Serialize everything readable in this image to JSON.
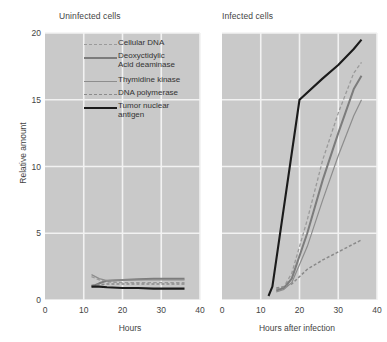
{
  "figure": {
    "yaxis": {
      "label": "Relative amount",
      "ticks": [
        "0",
        "5",
        "10",
        "15",
        "20"
      ],
      "min": 0,
      "max": 20
    },
    "panels": [
      {
        "title": "Uninfected cells",
        "xlabel": "Hours",
        "xticks": [
          "0",
          "10",
          "20",
          "30",
          "40"
        ]
      },
      {
        "title": "Infected cells",
        "xlabel": "Hours after infection",
        "xticks": [
          "0",
          "10",
          "20",
          "30",
          "40"
        ]
      }
    ],
    "legend": [
      {
        "label": "Cellular DNA",
        "style": "dashed-light",
        "color": "#9a9a9a"
      },
      {
        "label": "Deoxyctidylic\nAcid deaminase",
        "line1": "Deoxyctidylic",
        "line2": "Acid deaminase",
        "style": "solid-thick",
        "color": "#7c7c7c"
      },
      {
        "label": "Thymidine kinase",
        "style": "solid-thin",
        "color": "#8d8d8d"
      },
      {
        "label": "DNA polymerase",
        "style": "dashed-dark",
        "color": "#8a8a8a"
      },
      {
        "label": "Tumor nuclear\nantigen",
        "line1": "Tumor nuclear",
        "line2": "antigen",
        "style": "solid-black",
        "color": "#1b1b1b"
      }
    ],
    "colors": {
      "panel_background": "#c9c9c9",
      "gridline": "#f2f2f2",
      "text": "#444444"
    }
  },
  "chart_data": {
    "type": "line",
    "ylabel": "Relative amount",
    "ylim": [
      0,
      20
    ],
    "yticks": [
      0,
      5,
      10,
      15,
      20
    ],
    "grid": true,
    "legend_position": "inside-left-panel-top",
    "panels": [
      {
        "title": "Uninfected cells",
        "xlabel": "Hours",
        "xlim": [
          0,
          40
        ],
        "xticks": [
          0,
          10,
          20,
          30,
          40
        ],
        "series": [
          {
            "name": "Cellular DNA",
            "style": "dashed-light",
            "color": "#9a9a9a",
            "x": [
              12,
              14,
              16,
              20,
              24,
              28,
              32,
              36
            ],
            "y": [
              1.75,
              1.5,
              1.35,
              1.3,
              1.3,
              1.3,
              1.3,
              1.3
            ]
          },
          {
            "name": "Deoxyctidylic Acid deaminase",
            "style": "solid-thick",
            "color": "#7c7c7c",
            "x": [
              12,
              14,
              16,
              20,
              24,
              28,
              32,
              36
            ],
            "y": [
              1.0,
              1.25,
              1.45,
              1.5,
              1.55,
              1.6,
              1.6,
              1.6
            ]
          },
          {
            "name": "Thymidine kinase",
            "style": "solid-thin",
            "color": "#8d8d8d",
            "x": [
              12,
              14,
              16,
              20,
              24,
              28,
              32,
              36
            ],
            "y": [
              1.9,
              1.6,
              1.45,
              1.5,
              1.5,
              1.5,
              1.5,
              1.5
            ]
          },
          {
            "name": "DNA polymerase",
            "style": "dashed-dark",
            "color": "#8a8a8a",
            "x": [
              12,
              14,
              16,
              20,
              24,
              28,
              32,
              36
            ],
            "y": [
              1.1,
              1.15,
              1.2,
              1.2,
              1.2,
              1.2,
              1.2,
              1.2
            ]
          },
          {
            "name": "Tumor nuclear antigen",
            "style": "solid-black",
            "color": "#1b1b1b",
            "x": [
              12,
              14,
              16,
              20,
              24,
              28,
              32,
              36
            ],
            "y": [
              1.0,
              1.0,
              0.95,
              0.9,
              0.9,
              0.85,
              0.85,
              0.85
            ]
          }
        ]
      },
      {
        "title": "Infected cells",
        "xlabel": "Hours after infection",
        "xlim": [
          0,
          40
        ],
        "xticks": [
          0,
          10,
          20,
          30,
          40
        ],
        "series": [
          {
            "name": "Cellular DNA",
            "style": "dashed-light",
            "color": "#9a9a9a",
            "x": [
              14,
              16,
              18,
              22,
              26,
              30,
              34,
              36
            ],
            "y": [
              0.8,
              1.0,
              2.0,
              6.0,
              10.5,
              14.0,
              17.0,
              17.8
            ]
          },
          {
            "name": "Deoxyctidylic Acid deaminase",
            "style": "solid-thick",
            "color": "#7c7c7c",
            "x": [
              14,
              16,
              18,
              22,
              26,
              30,
              34,
              36
            ],
            "y": [
              0.7,
              0.9,
              1.6,
              5.0,
              9.0,
              12.5,
              15.8,
              16.8
            ]
          },
          {
            "name": "Thymidine kinase",
            "style": "solid-thin",
            "color": "#8d8d8d",
            "x": [
              14,
              16,
              18,
              22,
              26,
              30,
              34,
              36
            ],
            "y": [
              0.6,
              0.8,
              1.3,
              4.0,
              7.5,
              10.8,
              13.8,
              15.0
            ]
          },
          {
            "name": "DNA polymerase",
            "style": "dashed-dark",
            "color": "#8a8a8a",
            "x": [
              14,
              16,
              18,
              22,
              26,
              30,
              34,
              36
            ],
            "y": [
              0.9,
              1.0,
              1.2,
              2.3,
              3.0,
              3.6,
              4.2,
              4.5
            ]
          },
          {
            "name": "Tumor nuclear antigen",
            "style": "solid-black",
            "color": "#1b1b1b",
            "x": [
              12,
              13,
              20,
              26,
              30,
              34,
              36
            ],
            "y": [
              0.3,
              1.0,
              15.0,
              16.6,
              17.6,
              18.8,
              19.5
            ]
          }
        ]
      }
    ]
  }
}
